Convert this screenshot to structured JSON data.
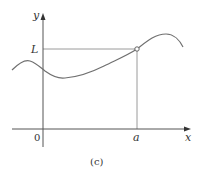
{
  "figure": {
    "caption": "(c)",
    "axes": {
      "x_label": "x",
      "y_label": "y",
      "origin_label": "0"
    },
    "marks": {
      "x_mark_label": "a",
      "y_mark_label": "L",
      "point": "open circle at (a, L)"
    },
    "curve": {
      "description": "smooth wavy curve: small local max left of y-axis, local min just right of y-axis, rises through (a, L) to a maximum, then falls",
      "color": "#707070"
    },
    "colors": {
      "axes": "#555555",
      "guide_lines": "#9a9a9a",
      "text": "#333333"
    }
  }
}
